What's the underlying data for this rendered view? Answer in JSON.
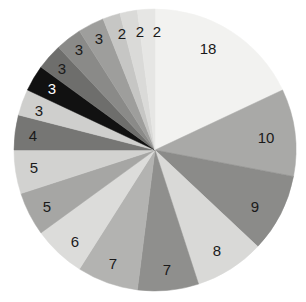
{
  "chart_data": {
    "type": "pie",
    "title": "",
    "subtitle": "",
    "xlabel": "",
    "ylabel": "",
    "legend": "none",
    "grid": false,
    "total": 100,
    "start_angle_deg": 0,
    "direction": "clockwise",
    "center": {
      "x": 155,
      "y": 150
    },
    "radius": 141,
    "labels_inside": true,
    "categories": [
      "18",
      "10",
      "9",
      "8",
      "7",
      "7",
      "6",
      "5",
      "5",
      "4",
      "3",
      "3",
      "3",
      "3",
      "3",
      "2",
      "2",
      "2"
    ],
    "values": [
      18,
      10,
      9,
      8,
      7,
      7,
      6,
      5,
      5,
      4,
      3,
      3,
      3,
      3,
      3,
      2,
      2,
      2
    ],
    "slices": [
      {
        "label": "18",
        "value": 18,
        "color": "#f2f2f0",
        "label_color": "#1a1a1a"
      },
      {
        "label": "10",
        "value": 10,
        "color": "#a9a9a7",
        "label_color": "#1a1a1a"
      },
      {
        "label": "9",
        "value": 9,
        "color": "#8b8b89",
        "label_color": "#1a1a1a"
      },
      {
        "label": "8",
        "value": 8,
        "color": "#d9d9d7",
        "label_color": "#1a1a1a"
      },
      {
        "label": "7",
        "value": 7,
        "color": "#8f8f8d",
        "label_color": "#1a1a1a"
      },
      {
        "label": "7",
        "value": 7,
        "color": "#b3b3b1",
        "label_color": "#1a1a1a"
      },
      {
        "label": "6",
        "value": 6,
        "color": "#dcdcda",
        "label_color": "#1a1a1a"
      },
      {
        "label": "5",
        "value": 5,
        "color": "#a6a6a4",
        "label_color": "#1a1a1a"
      },
      {
        "label": "5",
        "value": 5,
        "color": "#d2d2d0",
        "label_color": "#1a1a1a"
      },
      {
        "label": "4",
        "value": 4,
        "color": "#767674",
        "label_color": "#1a1a1a"
      },
      {
        "label": "3",
        "value": 3,
        "color": "#cfcfcd",
        "label_color": "#1a1a1a"
      },
      {
        "label": "3",
        "value": 3,
        "color": "#111111",
        "label_color": "#ffffff"
      },
      {
        "label": "3",
        "value": 3,
        "color": "#6e6e6c",
        "label_color": "#1a1a1a"
      },
      {
        "label": "3",
        "value": 3,
        "color": "#8a8a88",
        "label_color": "#1a1a1a"
      },
      {
        "label": "3",
        "value": 3,
        "color": "#9e9e9c",
        "label_color": "#1a1a1a"
      },
      {
        "label": "2",
        "value": 2,
        "color": "#c6c6c4",
        "label_color": "#1a1a1a"
      },
      {
        "label": "2",
        "value": 2,
        "color": "#dadad8",
        "label_color": "#1a1a1a"
      },
      {
        "label": "2",
        "value": 2,
        "color": "#e6e6e4",
        "label_color": "#1a1a1a"
      }
    ],
    "label_positions": [
      {
        "label": "18",
        "x": 208,
        "y": 50
      },
      {
        "label": "10",
        "x": 266,
        "y": 139
      },
      {
        "label": "9",
        "x": 255,
        "y": 208
      },
      {
        "label": "8",
        "x": 217,
        "y": 252
      },
      {
        "label": "7",
        "x": 167,
        "y": 271
      },
      {
        "label": "7",
        "x": 113,
        "y": 265
      },
      {
        "label": "6",
        "x": 75,
        "y": 243
      },
      {
        "label": "5",
        "x": 47,
        "y": 208
      },
      {
        "label": "5",
        "x": 34,
        "y": 169
      },
      {
        "label": "4",
        "x": 33,
        "y": 137
      },
      {
        "label": "3",
        "x": 39,
        "y": 112
      },
      {
        "label": "3",
        "x": 52,
        "y": 90
      },
      {
        "label": "3",
        "x": 62,
        "y": 70
      },
      {
        "label": "3",
        "x": 79,
        "y": 51
      },
      {
        "label": "3",
        "x": 99,
        "y": 40
      },
      {
        "label": "2",
        "x": 122,
        "y": 35
      },
      {
        "label": "2",
        "x": 140,
        "y": 33
      },
      {
        "label": "2",
        "x": 157,
        "y": 33
      }
    ],
    "background_color": "#ffffff"
  }
}
